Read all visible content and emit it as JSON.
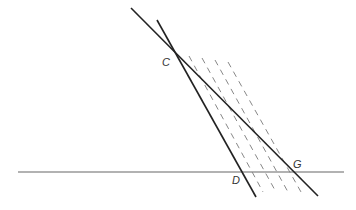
{
  "diagram": {
    "colors": {
      "solid_line": "#222222",
      "base_line": "#666666",
      "dashed_line": "#888888",
      "label": "#333333"
    },
    "points": [
      {
        "id": "C",
        "label": "C"
      },
      {
        "id": "D",
        "label": "D"
      },
      {
        "id": "G",
        "label": "G"
      }
    ],
    "lines": [
      {
        "id": "base",
        "kind": "solid",
        "through": []
      },
      {
        "id": "CD",
        "kind": "solid",
        "through": [
          "C",
          "D"
        ]
      },
      {
        "id": "CG",
        "kind": "solid",
        "through": [
          "C",
          "G"
        ]
      }
    ],
    "dashed_parallels": {
      "count": 4,
      "parallel_to": "CD"
    }
  }
}
